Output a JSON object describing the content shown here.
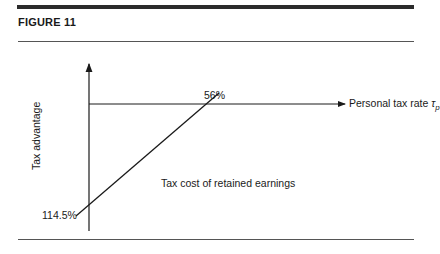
{
  "figure": {
    "title": "FIGURE 11"
  },
  "diagram": {
    "y_axis_label": "Tax advantage",
    "x_axis_label": "Personal tax rate",
    "x_axis_symbol": "τ",
    "x_axis_subscript": "p",
    "line_label": "Tax cost of retained earnings",
    "intercept_label": "114.5%",
    "crossing_label": "56%"
  }
}
